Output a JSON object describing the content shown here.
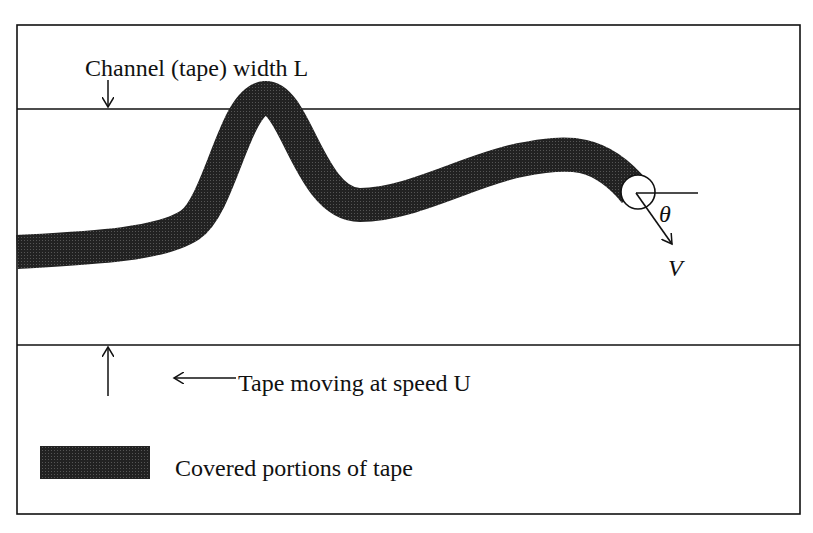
{
  "diagram": {
    "labels": {
      "channel_width": "Channel (tape) width L",
      "tape_motion": "Tape moving at speed U",
      "legend": "Covered portions of tape",
      "theta": "θ",
      "velocity": "V"
    },
    "colors": {
      "stroke": "#1a1a1a",
      "fill": "#262626",
      "background": "#ffffff"
    }
  }
}
